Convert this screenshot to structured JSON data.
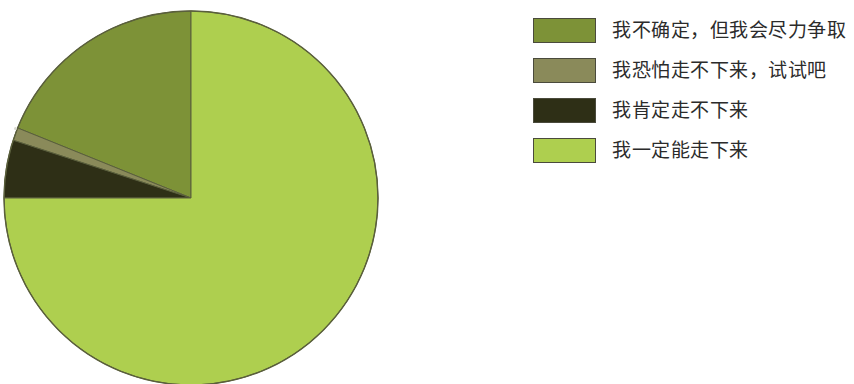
{
  "chart_data": {
    "type": "pie",
    "title": "",
    "categories": [
      "我不确定，但我会尽力争取",
      "我恐怕走不下来，试试吧",
      "我肯定走不下来",
      "我一定能走下来"
    ],
    "values": [
      19,
      1,
      5,
      75
    ],
    "units": "percent",
    "start_angle_deg": 0,
    "direction": "counterclockwise",
    "legend_position": "right",
    "grid": false,
    "colors": [
      "#7d9237",
      "#8a8a5a",
      "#2e2f16",
      "#aecf4f"
    ],
    "slices": [
      {
        "label": "我不确定，但我会尽力争取",
        "value": 19,
        "color": "#7d9237",
        "sweep_deg": 68
      },
      {
        "label": "我恐怕走不下来，试试吧",
        "value": 1,
        "color": "#8a8a5a",
        "sweep_deg": 4
      },
      {
        "label": "我肯定走不下来",
        "value": 5,
        "color": "#2e2f16",
        "sweep_deg": 18
      },
      {
        "label": "我一定能走下来",
        "value": 75,
        "color": "#aecf4f",
        "sweep_deg": 270
      }
    ]
  },
  "legend": {
    "items": [
      {
        "label": "我不确定，但我会尽力争取",
        "color": "#7d9237",
        "swatch_name": "legend-swatch-uncertain-but-try"
      },
      {
        "label": "我恐怕走不下来，试试吧",
        "color": "#8a8a5a",
        "swatch_name": "legend-swatch-probably-cannot-finish"
      },
      {
        "label": "我肯定走不下来",
        "color": "#2e2f16",
        "swatch_name": "legend-swatch-definitely-cannot-finish"
      },
      {
        "label": "我一定能走下来",
        "color": "#aecf4f",
        "swatch_name": "legend-swatch-definitely-can-finish"
      }
    ]
  },
  "pie": {
    "center_x": 191,
    "center_y": 198,
    "radius": 187,
    "outline_color": "#5a5f3c"
  }
}
